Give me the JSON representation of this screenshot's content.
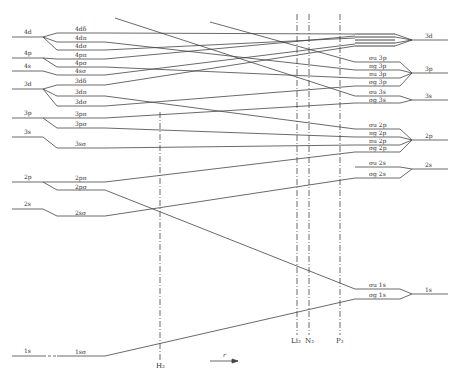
{
  "diagram": {
    "type": "molecular-orbital-correlation-diagram",
    "axis_label": "r",
    "united_atom_levels": [
      {
        "label": "4d",
        "y": 37
      },
      {
        "label": "4p",
        "y": 58
      },
      {
        "label": "4s",
        "y": 71
      },
      {
        "label": "3d",
        "y": 89
      },
      {
        "label": "3p",
        "y": 118
      },
      {
        "label": "3s",
        "y": 137
      },
      {
        "label": "2p",
        "y": 182
      },
      {
        "label": "2s",
        "y": 209
      },
      {
        "label": "1s",
        "y": 356
      }
    ],
    "united_atom_mo_levels": [
      {
        "label": "4dδ",
        "y": 33
      },
      {
        "label": "4dπ",
        "y": 42
      },
      {
        "label": "4dσ",
        "y": 50
      },
      {
        "label": "4pπ",
        "y": 59
      },
      {
        "label": "4pσ",
        "y": 67
      },
      {
        "label": "4sσ",
        "y": 75
      },
      {
        "label": "3dδ",
        "y": 85
      },
      {
        "label": "3dπ",
        "y": 96
      },
      {
        "label": "3dσ",
        "y": 106
      },
      {
        "label": "3pπ",
        "y": 118
      },
      {
        "label": "3pσ",
        "y": 128
      },
      {
        "label": "3sσ",
        "y": 148
      },
      {
        "label": "2pπ",
        "y": 182
      },
      {
        "label": "2pσ",
        "y": 190
      },
      {
        "label": "2sσ",
        "y": 216
      },
      {
        "label": "1sσ",
        "y": 356
      }
    ],
    "separated_atom_mo_levels": [
      {
        "label": "σu 3p",
        "y": 62
      },
      {
        "label": "πg 3p",
        "y": 70
      },
      {
        "label": "πu 3p",
        "y": 78
      },
      {
        "label": "σg 3p",
        "y": 86
      },
      {
        "label": "σu 3s",
        "y": 96
      },
      {
        "label": "σg 3s",
        "y": 103
      },
      {
        "label": "σu 2p",
        "y": 129
      },
      {
        "label": "πg 2p",
        "y": 137
      },
      {
        "label": "πu 2p",
        "y": 145
      },
      {
        "label": "σg 2p",
        "y": 152
      },
      {
        "label": "σu 2s",
        "y": 167
      },
      {
        "label": "σg 2s",
        "y": 178
      },
      {
        "label": "σu 1s",
        "y": 289
      },
      {
        "label": "σg 1s",
        "y": 299
      }
    ],
    "separated_atom_levels": [
      {
        "label": "3d",
        "y": 40
      },
      {
        "label": "3p",
        "y": 73
      },
      {
        "label": "3s",
        "y": 100
      },
      {
        "label": "2p",
        "y": 140
      },
      {
        "label": "2s",
        "y": 169
      },
      {
        "label": "1s",
        "y": 294
      }
    ],
    "molecule_markers": [
      {
        "label": "H₂",
        "x": 160
      },
      {
        "label": "Li₂",
        "x": 297
      },
      {
        "label": "N₂",
        "x": 309
      },
      {
        "label": "P₂",
        "x": 340
      }
    ]
  }
}
